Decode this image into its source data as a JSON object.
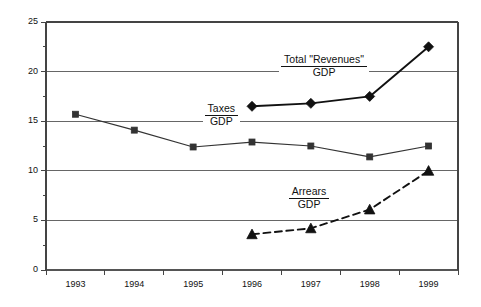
{
  "chart_data": {
    "type": "line",
    "title": "",
    "xlabel": "",
    "ylabel": "",
    "categories": [
      "1993",
      "1994",
      "1995",
      "1996",
      "1997",
      "1998",
      "1999"
    ],
    "ylim": [
      0,
      25
    ],
    "yticks": [
      "0",
      "5",
      "10",
      "15",
      "20",
      "25"
    ],
    "ytick_values": [
      0,
      5,
      10,
      15,
      20,
      25
    ],
    "minor_tick_step": 2.5,
    "grid": "horizontal",
    "legend": "none",
    "series": [
      {
        "name": "Taxes/GDP",
        "marker": "square",
        "line_style": "solid",
        "color": "#333333",
        "x": [
          "1993",
          "1994",
          "1995",
          "1996",
          "1997",
          "1998",
          "1999"
        ],
        "values": [
          15.7,
          14.1,
          12.4,
          12.9,
          12.5,
          11.4,
          12.5
        ]
      },
      {
        "name": "Total \"Revenues\"/GDP",
        "marker": "diamond",
        "line_style": "solid",
        "color": "#111111",
        "x": [
          "1996",
          "1997",
          "1998",
          "1999"
        ],
        "values": [
          16.5,
          16.8,
          17.5,
          22.5
        ]
      },
      {
        "name": "Arrears/GDP",
        "marker": "triangle",
        "line_style": "dashed",
        "color": "#111111",
        "x": [
          "1996",
          "1997",
          "1998",
          "1999"
        ],
        "values": [
          3.6,
          4.2,
          6.1,
          10.0
        ]
      }
    ],
    "annotations": [
      {
        "name": "taxes-label",
        "numerator": "Taxes",
        "denominator": "GDP",
        "x_frac": 0.425,
        "y_value": 15.6
      },
      {
        "name": "total-revenues-label",
        "numerator": "Total \"Revenues\"",
        "denominator": "GDP",
        "x_frac": 0.675,
        "y_value": 20.6
      },
      {
        "name": "arrears-label",
        "numerator": "Arrears",
        "denominator": "GDP",
        "x_frac": 0.638,
        "y_value": 7.3
      }
    ]
  }
}
